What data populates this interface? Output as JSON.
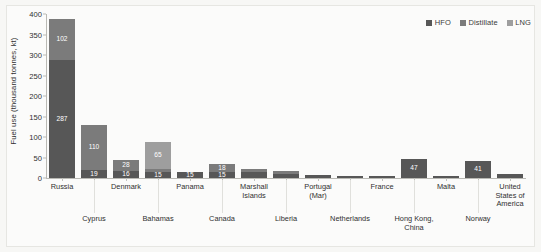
{
  "chart_data": {
    "type": "bar",
    "subtype": "stacked-bar",
    "title": "",
    "xlabel": "",
    "ylabel": "Fuel use (thousand tonnes, kt)",
    "ylim": [
      0,
      400
    ],
    "yticks": [
      0,
      50,
      100,
      150,
      200,
      250,
      300,
      350,
      400
    ],
    "grid": false,
    "legend_position": "top-right",
    "categories": [
      "Russia",
      "Cyprus",
      "Denmark",
      "Bahamas",
      "Panama",
      "Canada",
      "Marshall Islands",
      "Liberia",
      "Portugal (Mar)",
      "Netherlands",
      "France",
      "Hong Kong, China",
      "Malta",
      "Norway",
      "United States of America"
    ],
    "series": [
      {
        "name": "HFO",
        "color": "#575757",
        "values": [
          287,
          19,
          16,
          15,
          15,
          15,
          14,
          11,
          8,
          5,
          6,
          47,
          6,
          41,
          9
        ]
      },
      {
        "name": "Distillate",
        "color": "#7b7b7b",
        "values": [
          102,
          110,
          28,
          7,
          0,
          18,
          9,
          5,
          0,
          0,
          0,
          0,
          0,
          0,
          0
        ]
      },
      {
        "name": "LNG",
        "color": "#9e9e9e",
        "values": [
          0,
          0,
          0,
          65,
          0,
          0,
          0,
          0,
          0,
          0,
          0,
          0,
          0,
          0,
          0
        ]
      }
    ],
    "bar_labels": [
      {
        "category": "Russia",
        "labels": [
          {
            "series": "HFO",
            "value": "287"
          },
          {
            "series": "Distillate",
            "value": "102"
          }
        ]
      },
      {
        "category": "Cyprus",
        "labels": [
          {
            "series": "HFO",
            "value": "19"
          },
          {
            "series": "Distillate",
            "value": "110"
          }
        ]
      },
      {
        "category": "Denmark",
        "labels": [
          {
            "series": "HFO",
            "value": "16"
          },
          {
            "series": "Distillate",
            "value": "28"
          }
        ]
      },
      {
        "category": "Bahamas",
        "labels": [
          {
            "series": "HFO",
            "value": "15"
          },
          {
            "series": "Distillate",
            "value": "7"
          },
          {
            "series": "LNG",
            "value": "65"
          }
        ]
      },
      {
        "category": "Panama",
        "labels": [
          {
            "series": "HFO",
            "value": "15"
          }
        ]
      },
      {
        "category": "Canada",
        "labels": [
          {
            "series": "HFO",
            "value": "15"
          },
          {
            "series": "Distillate",
            "value": "18"
          }
        ]
      },
      {
        "category": "Marshall Islands",
        "labels": [
          {
            "series": "HFO",
            "value": "14"
          },
          {
            "series": "Distillate",
            "value": "9"
          }
        ]
      },
      {
        "category": "Liberia",
        "labels": [
          {
            "series": "HFO",
            "value": "11"
          },
          {
            "series": "Distillate",
            "value": "5"
          }
        ]
      },
      {
        "category": "Portugal (Mar)",
        "labels": [
          {
            "series": "HFO",
            "value": "8"
          }
        ]
      },
      {
        "category": "Netherlands",
        "labels": [
          {
            "series": "HFO",
            "value": "5"
          }
        ]
      },
      {
        "category": "France",
        "labels": [
          {
            "series": "HFO",
            "value": "6"
          }
        ]
      },
      {
        "category": "Hong Kong, China",
        "labels": [
          {
            "series": "HFO",
            "value": "47"
          }
        ]
      },
      {
        "category": "Malta",
        "labels": [
          {
            "series": "HFO",
            "value": "6"
          }
        ]
      },
      {
        "category": "Norway",
        "labels": [
          {
            "series": "HFO",
            "value": "41"
          }
        ]
      },
      {
        "category": "United States of America",
        "labels": [
          {
            "series": "HFO",
            "value": "9"
          }
        ]
      }
    ]
  },
  "axis": {
    "y_title": "Fuel use (thousand tonnes, kt)",
    "y_ticks": [
      "400",
      "350",
      "300",
      "250",
      "200",
      "150",
      "100",
      "50",
      "0"
    ]
  },
  "legend": {
    "items": [
      {
        "label": "HFO",
        "color": "#575757"
      },
      {
        "label": "Distillate",
        "color": "#7b7b7b"
      },
      {
        "label": "LNG",
        "color": "#9e9e9e"
      }
    ]
  },
  "x_axis_labels": [
    {
      "text": "Russia",
      "row": "top"
    },
    {
      "text": "Cyprus",
      "row": "bottom"
    },
    {
      "text": "Denmark",
      "row": "top"
    },
    {
      "text": "Bahamas",
      "row": "bottom"
    },
    {
      "text": "Panama",
      "row": "top"
    },
    {
      "text": "Canada",
      "row": "bottom"
    },
    {
      "text": "Marshall Islands",
      "row": "top"
    },
    {
      "text": "Liberia",
      "row": "bottom"
    },
    {
      "text": "Portugal (Mar)",
      "row": "top"
    },
    {
      "text": "Netherlands",
      "row": "bottom"
    },
    {
      "text": "France",
      "row": "top"
    },
    {
      "text": "Hong Kong, China",
      "row": "bottom"
    },
    {
      "text": "Malta",
      "row": "top"
    },
    {
      "text": "Norway",
      "row": "bottom"
    },
    {
      "text": "United States of America",
      "row": "top"
    }
  ],
  "colors": {
    "background": "#f7f7f5",
    "plot_background": "#fbfbfa",
    "axis": "#b9b9b4",
    "text": "#2f2f2f"
  }
}
